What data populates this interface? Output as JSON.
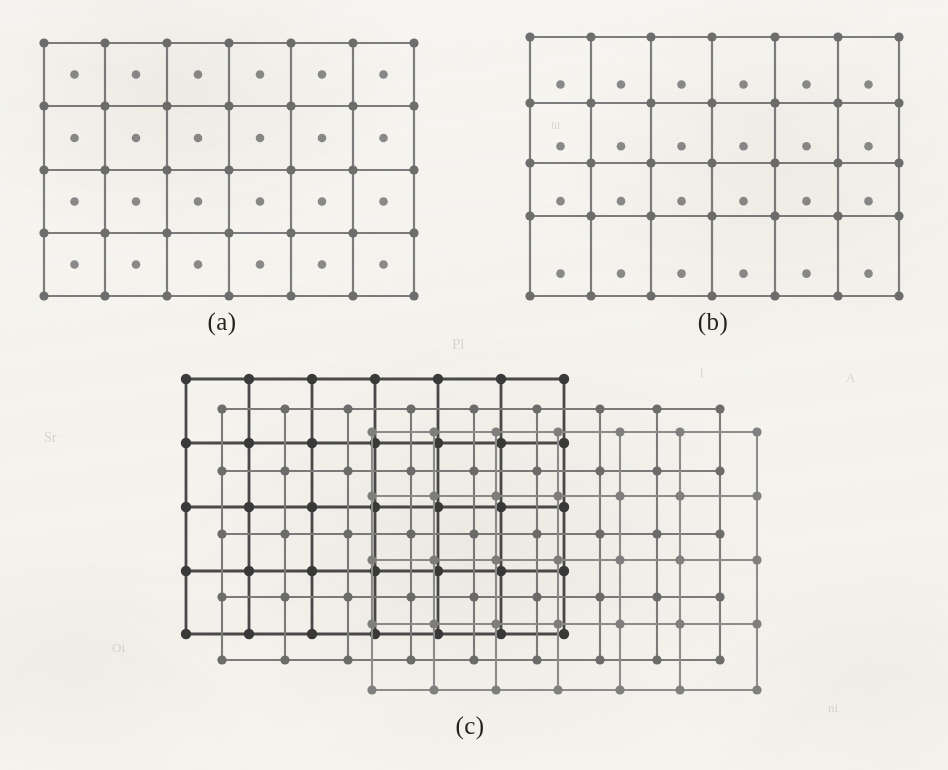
{
  "figure": {
    "width": 948,
    "height": 770,
    "background_color": "#f7f5f1"
  },
  "colors": {
    "dark_grid_line": "#4a4a4a",
    "dark_grid_node": "#3a3a3a",
    "mid_grid_line": "#7d7d7d",
    "mid_grid_node": "#6e6e6e",
    "light_grid_line": "#8f8f8f",
    "light_grid_node": "#828282",
    "cell_dot": "#8a8a8a",
    "label_text": "#26231f",
    "paper": "#f7f5f1"
  },
  "panels": [
    {
      "id": "panel-a",
      "label": "(a)",
      "label_x": 222,
      "label_y": 322,
      "description": "Uniform rectangular grid with a dot at the centre of every cell",
      "grids": [
        {
          "id": "grid-a-main",
          "tone": "mid",
          "line_width": 2.2,
          "node_radius": 4.6,
          "x_positions": [
            44,
            105,
            167,
            229,
            291,
            353,
            414
          ],
          "y_positions": [
            43,
            106,
            170,
            233,
            296
          ],
          "cell_dots": true,
          "cell_dot_radius": 4.3,
          "cell_dot_offset_x": 0.5,
          "cell_dot_offset_y": 0.5
        }
      ]
    },
    {
      "id": "panel-b",
      "label": "(b)",
      "label_x": 713,
      "label_y": 322,
      "description": "Non-uniform rectangular grid with unequal row heights and offset cell dots",
      "grids": [
        {
          "id": "grid-b-main",
          "tone": "mid",
          "line_width": 2.2,
          "node_radius": 4.6,
          "x_positions": [
            530,
            591,
            651,
            712,
            775,
            838,
            899
          ],
          "y_positions": [
            37,
            103,
            163,
            216,
            296
          ],
          "cell_dots": true,
          "cell_dot_radius": 4.3,
          "cell_dot_offset_x": 0.5,
          "cell_dot_offset_y": 0.72
        }
      ]
    },
    {
      "id": "panel-c",
      "label": "(c)",
      "label_x": 470,
      "label_y": 726,
      "description": "Three congruent grids superimposed with progressive diagonal offsets",
      "grids": [
        {
          "id": "grid-c-dark",
          "tone": "dark",
          "line_width": 2.8,
          "node_radius": 5.2,
          "x_positions": [
            186,
            249,
            312,
            375,
            438,
            501,
            564
          ],
          "y_positions": [
            379,
            443,
            507,
            571,
            634
          ],
          "cell_dots": false,
          "cell_dot_radius": 0,
          "cell_dot_offset_x": 0.5,
          "cell_dot_offset_y": 0.5
        },
        {
          "id": "grid-c-mid",
          "tone": "mid",
          "line_width": 2.1,
          "node_radius": 4.6,
          "x_positions": [
            222,
            285,
            348,
            411,
            474,
            537,
            600,
            657,
            720
          ],
          "y_positions": [
            409,
            471,
            534,
            597,
            660
          ],
          "cell_dots": false,
          "cell_dot_radius": 0,
          "cell_dot_offset_x": 0.5,
          "cell_dot_offset_y": 0.5
        },
        {
          "id": "grid-c-light",
          "tone": "light",
          "line_width": 2.1,
          "node_radius": 4.6,
          "x_positions": [
            372,
            434,
            496,
            558,
            620,
            680,
            757
          ],
          "y_positions": [
            432,
            496,
            560,
            624,
            690
          ],
          "cell_dots": false,
          "cell_dot_radius": 0,
          "cell_dot_offset_x": 0.5,
          "cell_dot_offset_y": 0.5
        }
      ]
    }
  ],
  "ghost_marks": [
    {
      "text": "Pl",
      "x": 452,
      "y": 336,
      "size": 15
    },
    {
      "text": "lil",
      "x": 551,
      "y": 119,
      "size": 11
    },
    {
      "text": "Sr",
      "x": 44,
      "y": 430,
      "size": 14
    },
    {
      "text": "A",
      "x": 846,
      "y": 370,
      "size": 13
    },
    {
      "text": "Oi",
      "x": 112,
      "y": 640,
      "size": 13
    },
    {
      "text": "ni",
      "x": 828,
      "y": 700,
      "size": 13
    },
    {
      "text": "l",
      "x": 700,
      "y": 366,
      "size": 12
    }
  ]
}
